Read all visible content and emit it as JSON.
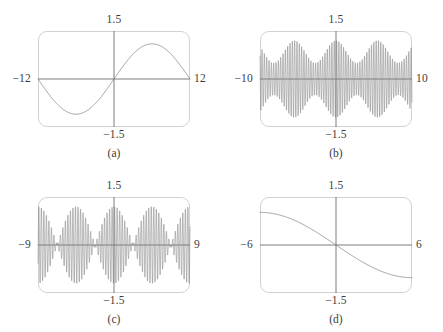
{
  "figure": {
    "background": "#ffffff",
    "curve_color": "#7b7b7b",
    "axis_color": "#6e6e6e",
    "frame_color": "#d2d2d2",
    "panel_count": 4
  },
  "panels": [
    {
      "caption": "(a)",
      "x_min_label": "−12",
      "x_max_label": "12",
      "y_max_label": "1.5",
      "y_min_label": "−1.5"
    },
    {
      "caption": "(b)",
      "x_min_label": "−10",
      "x_max_label": "10",
      "y_max_label": "1.5",
      "y_min_label": "−1.5"
    },
    {
      "caption": "(c)",
      "x_min_label": "−9",
      "x_max_label": "9",
      "y_max_label": "1.5",
      "y_min_label": "−1.5"
    },
    {
      "caption": "(d)",
      "x_min_label": "−6",
      "x_max_label": "6",
      "y_max_label": "1.5",
      "y_min_label": "−1.5"
    }
  ],
  "chart_data": [
    {
      "type": "line",
      "title": "(a)",
      "xlabel": "",
      "ylabel": "",
      "xlim": [
        -12,
        12
      ],
      "ylim": [
        -1.5,
        1.5
      ],
      "grid": false,
      "legend": null,
      "xticks": [
        -12,
        12
      ],
      "yticks": [
        -1.5,
        1.5
      ],
      "xticklabels": [
        "−12",
        "12"
      ],
      "yticklabels": [
        "−1.5",
        "1.5"
      ],
      "annotations": [
        "single slow sine period, amplitude about 1.1, zero crossing at x=0, trough near x=-6, crest near x=6"
      ],
      "series": [
        {
          "name": "y = 1.1 sin(pi x / 12)",
          "amplitude": 1.1,
          "period": 24,
          "phase": 0,
          "samples": 601
        }
      ]
    },
    {
      "type": "line",
      "title": "(b)",
      "xlabel": "",
      "ylabel": "",
      "xlim": [
        -10,
        10
      ],
      "ylim": [
        -1.5,
        1.5
      ],
      "grid": false,
      "legend": null,
      "xticks": [
        -10,
        10
      ],
      "yticks": [
        -1.5,
        1.5
      ],
      "xticklabels": [
        "−10",
        "10"
      ],
      "yticklabels": [
        "−1.5",
        "1.5"
      ],
      "annotations": [
        "dense high-frequency oscillation with partial beat modulation; envelope dips but never vanishes; amplitude varies between about 0.5 and 1.2"
      ],
      "series": [
        {
          "name": "y = (0.85 + 0.35 cos(1.15 x)) sin(20.5 x)",
          "carrier_frequency": 20.5,
          "envelope_mean": 0.85,
          "envelope_depth": 0.35,
          "envelope_frequency": 1.15,
          "samples": 4000
        }
      ]
    },
    {
      "type": "line",
      "title": "(c)",
      "xlabel": "",
      "ylabel": "",
      "xlim": [
        -9,
        9
      ],
      "ylim": [
        -1.5,
        1.5
      ],
      "grid": false,
      "legend": null,
      "xticks": [
        -9,
        9
      ],
      "yticks": [
        -1.5,
        1.5
      ],
      "xticklabels": [
        "−9",
        "9"
      ],
      "yticklabels": [
        "−1.5",
        "1.5"
      ],
      "annotations": [
        "beat pattern with full nodes near x = ±4.5; large central lobe peaking about 1.2 at x=0; smaller outer lobes near x = ±7"
      ],
      "series": [
        {
          "name": "y = 1.2 cos(0.7 x) sin(21 x)",
          "carrier_frequency": 21,
          "envelope_amplitude": 1.2,
          "envelope_frequency": 0.7,
          "nodes": [
            -4.5,
            4.5
          ],
          "samples": 4000
        }
      ]
    },
    {
      "type": "line",
      "title": "(d)",
      "xlabel": "",
      "ylabel": "",
      "xlim": [
        -6,
        6
      ],
      "ylim": [
        -1.5,
        1.5
      ],
      "grid": false,
      "legend": null,
      "xticks": [
        -6,
        6
      ],
      "yticks": [
        -1.5,
        1.5
      ],
      "xticklabels": [
        "−6",
        "6"
      ],
      "yticklabels": [
        "−1.5",
        "1.5"
      ],
      "annotations": [
        "monotone decreasing S-shaped curve from about +1.0 at x=-6 through 0 at x=0 to about -1.0 at x=6"
      ],
      "series": [
        {
          "name": "y = -1.02 sin(pi x / 12)",
          "amplitude": 1.02,
          "period": 24,
          "phase": 0,
          "decreasing": true,
          "samples": 601
        }
      ]
    }
  ]
}
